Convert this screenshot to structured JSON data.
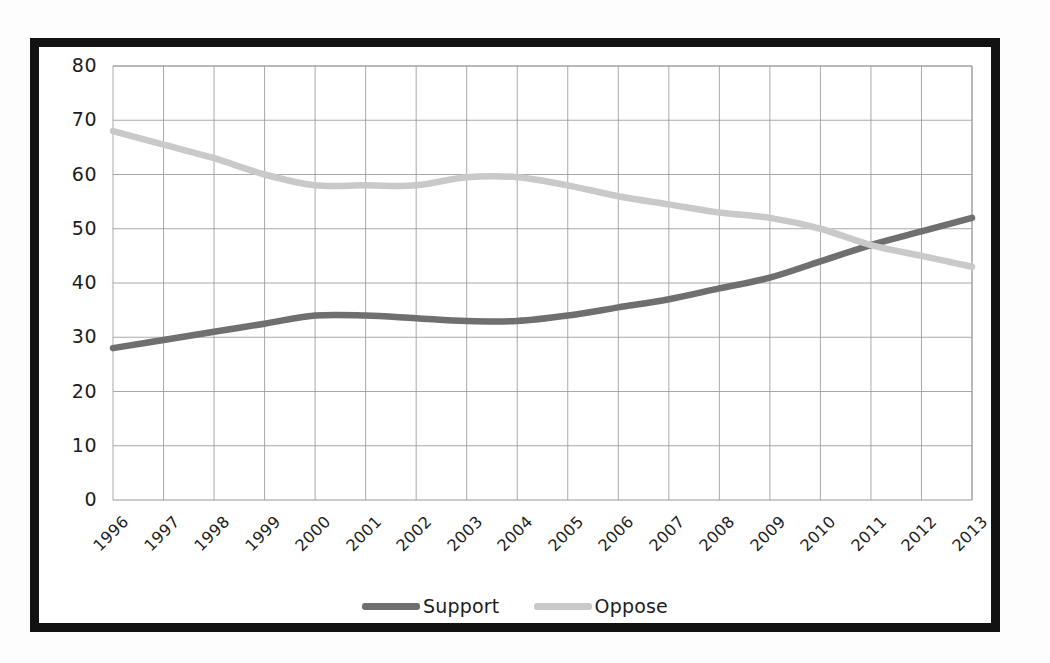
{
  "chart_data": {
    "type": "line",
    "title": "",
    "xlabel": "",
    "ylabel": "",
    "ylim": [
      0,
      80
    ],
    "ytick_step": 10,
    "yticks": [
      "80",
      "70",
      "60",
      "50",
      "40",
      "30",
      "20",
      "10",
      "0"
    ],
    "grid": true,
    "legend_position": "bottom-center",
    "categories": [
      "1996",
      "1997",
      "1998",
      "1999",
      "2000",
      "2001",
      "2002",
      "2003",
      "2004",
      "2005",
      "2006",
      "2007",
      "2008",
      "2009",
      "2010",
      "2011",
      "2012",
      "2013"
    ],
    "series": [
      {
        "name": "Support",
        "color": "#6f6f6f",
        "values": [
          28,
          29.5,
          31,
          32.5,
          34,
          34,
          33.5,
          33,
          33,
          34,
          35.5,
          37,
          39,
          41,
          44,
          47,
          49.5,
          52
        ]
      },
      {
        "name": "Oppose",
        "color": "#c9c9c9",
        "values": [
          68,
          65.5,
          63,
          60,
          58,
          58,
          58,
          59.5,
          59.5,
          58,
          56,
          54.5,
          53,
          52,
          50,
          47,
          45,
          43
        ]
      }
    ]
  },
  "legend": {
    "items": [
      {
        "label": "Support",
        "color": "#6f6f6f"
      },
      {
        "label": "Oppose",
        "color": "#c9c9c9"
      }
    ]
  },
  "frame": {
    "border_color": "#121212",
    "background": "#ffffff"
  }
}
